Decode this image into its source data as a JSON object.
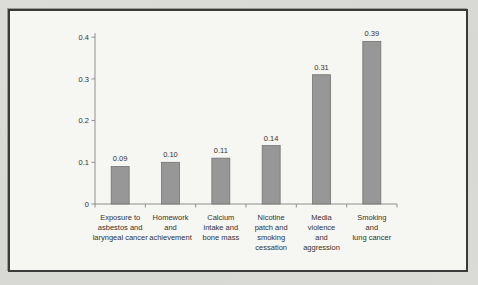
{
  "figure": {
    "page_background": "#d9d9d6",
    "panel_background": "#f6f6f3",
    "panel_border_color": "#3a3a3a"
  },
  "chart_data": {
    "type": "bar",
    "title": "",
    "categories": [
      "Exposure to asbestos and laryngeal cancer",
      "Homework and achievement",
      "Calcium intake and bone mass",
      "Nicotine patch and smoking cessation",
      "Media violence and aggression",
      "Smoking and lung cancer"
    ],
    "category_lines": [
      [
        "Exposure to",
        "asbestos and",
        "laryngeal cancer"
      ],
      [
        "Homework",
        "and",
        "achievement"
      ],
      [
        "Calcium",
        "intake and",
        "bone mass"
      ],
      [
        "Nicotine",
        "patch and",
        "smoking",
        "cessation"
      ],
      [
        "Media",
        "violence",
        "and",
        "aggression"
      ],
      [
        "Smoking",
        "and",
        "lung cancer"
      ]
    ],
    "values": [
      0.09,
      0.1,
      0.11,
      0.14,
      0.31,
      0.39
    ],
    "value_labels": [
      "0.09",
      "0.10",
      "0.11",
      "0.14",
      "0.31",
      "0.39"
    ],
    "ylim": [
      0,
      0.4
    ],
    "yticks": [
      0,
      0.1,
      0.2,
      0.3,
      0.4
    ],
    "ytick_labels": [
      "0",
      "0.1",
      "0.2",
      "0.3",
      "0.4"
    ],
    "grid": "off",
    "legend": "none",
    "bar_color": "#979797",
    "bar_edge_color": "#6f6f6f",
    "axis_color": "#8f8f8d",
    "text_color": "#333331"
  }
}
